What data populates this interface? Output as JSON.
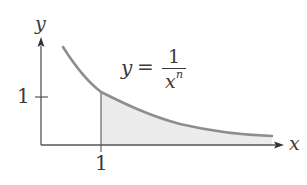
{
  "axes": {
    "x_label": "x",
    "y_label": "y",
    "x_tick_label": "1",
    "y_tick_label": "1"
  },
  "equation": {
    "lhs": "y",
    "equals": "=",
    "numerator": "1",
    "denominator_base": "x",
    "denominator_exponent": "n"
  },
  "colors": {
    "axis": "#555555",
    "curve": "#8e8e8e",
    "fill": "#ececec",
    "text": "#3a3a3a"
  }
}
